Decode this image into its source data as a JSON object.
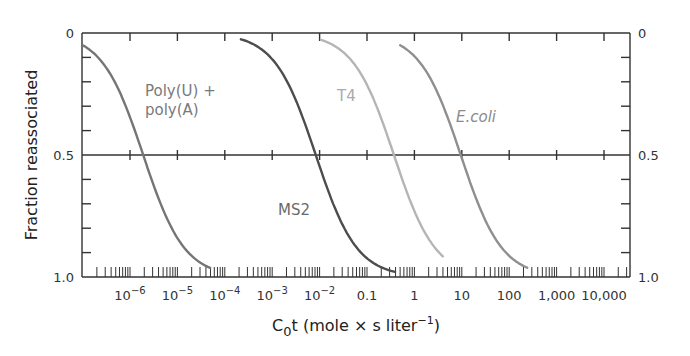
{
  "chart_data": {
    "type": "line",
    "title": "",
    "xlabel": "C0t (mole × s liter⁻¹)",
    "xlabel_parts": {
      "main": "C",
      "sub": "0",
      "rest": "t (mole × s liter",
      "sup": "−1",
      "close": ")"
    },
    "ylabel": "Fraction reassociated",
    "x_scale": "log",
    "xlim_log10": [
      -7.0,
      4.55
    ],
    "ylim": [
      0,
      1.0
    ],
    "y_inverted": true,
    "x_ticks": [
      {
        "log": -6,
        "base": "10",
        "exp": "−6"
      },
      {
        "log": -5,
        "base": "10",
        "exp": "−5"
      },
      {
        "log": -4,
        "base": "10",
        "exp": "−4"
      },
      {
        "log": -3,
        "base": "10",
        "exp": "−3"
      },
      {
        "log": -2,
        "base": "10",
        "exp": "−2"
      },
      {
        "log": -1,
        "label": "0.1"
      },
      {
        "log": 0,
        "label": "1"
      },
      {
        "log": 1,
        "label": "10"
      },
      {
        "log": 2,
        "label": "100"
      },
      {
        "log": 3,
        "label": "1,000"
      },
      {
        "log": 4,
        "label": "10,000"
      }
    ],
    "y_ticks_left": [
      "0",
      "0.5",
      "1.0"
    ],
    "y_ticks_right": [
      "0",
      "0.5",
      "1.0"
    ],
    "y_tick_values": [
      0,
      0.5,
      1.0
    ],
    "reference_line": 0.5,
    "series": [
      {
        "name": "Poly(U) + poly(A)",
        "label_lines": [
          "Poly(U) +",
          "poly(A)"
        ],
        "italic": false,
        "color": "#757575",
        "label_color": "#7a7a7a",
        "c0t_half": 1.9e-06,
        "x_range_log10": [
          -7.0,
          -4.31
        ],
        "label_pos": [
          145,
          96
        ]
      },
      {
        "name": "MS2",
        "label_lines": [
          "MS2"
        ],
        "italic": false,
        "color": "#4d4d4d",
        "label_color": "#6a6a6a",
        "c0t_half": 0.0083,
        "x_range_log10": [
          -3.66,
          -0.41
        ],
        "label_pos": [
          278,
          215
        ]
      },
      {
        "name": "T4",
        "label_lines": [
          "T4"
        ],
        "italic": false,
        "color": "#b5b5b5",
        "label_color": "#aaaaaa",
        "c0t_half": 0.37,
        "x_range_log10": [
          -1.97,
          0.6
        ],
        "label_pos": [
          337,
          101
        ]
      },
      {
        "name": "E.coli",
        "label_lines": [
          "E.coli"
        ],
        "italic": true,
        "color": "#8f8f8f",
        "label_color": "#8a8a8a",
        "c0t_half": 9.5,
        "x_range_log10": [
          -0.3,
          2.38
        ],
        "label_pos": [
          456,
          122
        ]
      }
    ]
  }
}
